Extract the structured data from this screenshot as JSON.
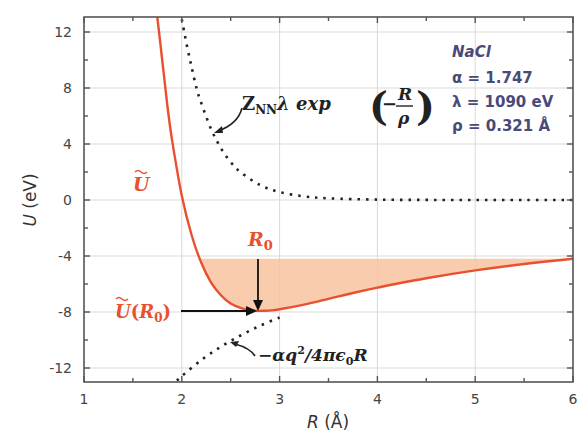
{
  "chart_data": {
    "type": "line",
    "title": "",
    "xlabel": "R (Å)",
    "ylabel": "U (eV)",
    "xlim": [
      1,
      6
    ],
    "ylim": [
      -13,
      13
    ],
    "x_ticks": [
      "1",
      "2",
      "3",
      "4",
      "5",
      "6"
    ],
    "y_ticks": [
      "-12",
      "-8",
      "-4",
      "0",
      "4",
      "8",
      "12"
    ],
    "grid": true,
    "series": [
      {
        "name": "Ũ (total potential)",
        "style": "solid",
        "color": "#e8502f",
        "x": [
          1.75,
          1.8,
          1.85,
          1.9,
          2.0,
          2.1,
          2.2,
          2.3,
          2.4,
          2.5,
          2.6,
          2.7,
          2.8,
          2.9,
          3.0,
          3.25,
          3.5,
          3.75,
          4.0,
          4.5,
          5.0,
          5.5,
          6.0
        ],
        "values": [
          13.7,
          10.0,
          6.9,
          4.3,
          0.3,
          -2.5,
          -4.5,
          -5.9,
          -6.8,
          -7.4,
          -7.7,
          -7.87,
          -7.92,
          -7.89,
          -7.81,
          -7.48,
          -7.06,
          -6.64,
          -6.26,
          -5.59,
          -5.03,
          -4.57,
          -4.19
        ]
      },
      {
        "name": "Z_NN λ exp(-R/ρ)",
        "style": "dotted",
        "color": "#222222",
        "x": [
          2.0,
          2.05,
          2.1,
          2.15,
          2.2,
          2.3,
          2.4,
          2.5,
          2.6,
          2.8,
          3.0,
          3.25,
          3.5,
          4.0,
          4.5,
          5.0,
          5.5,
          6.0
        ],
        "values": [
          12.9,
          11.1,
          9.5,
          8.0,
          6.9,
          5.06,
          3.7,
          2.71,
          1.99,
          1.07,
          0.57,
          0.26,
          0.12,
          0.026,
          0.005,
          0.001,
          0.0,
          0.0
        ]
      },
      {
        "name": "-αq²/4πε₀R",
        "style": "dotted",
        "color": "#222222",
        "x": [
          1.95,
          2.0,
          2.2,
          2.4,
          2.6,
          2.8,
          3.0
        ],
        "values": [
          -12.9,
          -12.58,
          -11.43,
          -10.48,
          -9.68,
          -8.98,
          -8.39
        ]
      }
    ],
    "shaded_region": {
      "description": "binding well between Ũ and U = -4.19",
      "color": "#f8c39f",
      "y_top": -4.19,
      "x_range": [
        2.19,
        6.0
      ]
    },
    "annotations": [
      {
        "text": "Ũ",
        "x": 1.5,
        "y": 2.5,
        "color": "#e8502f"
      },
      {
        "text": "R₀",
        "x": 2.81,
        "y": -3.2,
        "color": "#e8502f"
      },
      {
        "text": "Ũ(R₀)",
        "x": 1.35,
        "y": -8.0,
        "color": "#e8502f"
      },
      {
        "text": "Z_NN λ exp(−R/ρ)",
        "x": 2.45,
        "y": 7.4,
        "color": "#222222"
      },
      {
        "text": "−αq²/4πε₀R",
        "x": 2.7,
        "y": -11.5,
        "color": "#222222"
      }
    ],
    "legend_box": {
      "lines": [
        "NaCl",
        "α = 1.747",
        "λ = 1090 eV",
        "ρ = 0.321 Å"
      ]
    },
    "minimum": {
      "R0": 2.81,
      "U_min": -7.92
    }
  },
  "labels": {
    "xlabel_R": "R",
    "xlabel_unit": " (Å)",
    "ylabel_U": "U",
    "ylabel_unit": " (eV)",
    "u_tilde": "U",
    "r0_R": "R",
    "r0_sub": "0",
    "ur0_U": "U",
    "ur0_open": "(",
    "ur0_R": "R",
    "ur0_sub": "0",
    "ur0_close": ")",
    "rep_Z": "Z",
    "rep_sub": "NN",
    "rep_rest": "λ exp",
    "rep_minus": "−",
    "rep_num": "R",
    "rep_den": "ρ",
    "att_text": "−αq",
    "att_sup": "2",
    "att_rest": "/4πϵ",
    "att_sub": "0",
    "att_R": "R",
    "info_title": "NaCl",
    "info_alpha": "α = 1.747",
    "info_lambda": "λ = 1090 eV",
    "info_rho": "ρ = 0.321 Å"
  }
}
